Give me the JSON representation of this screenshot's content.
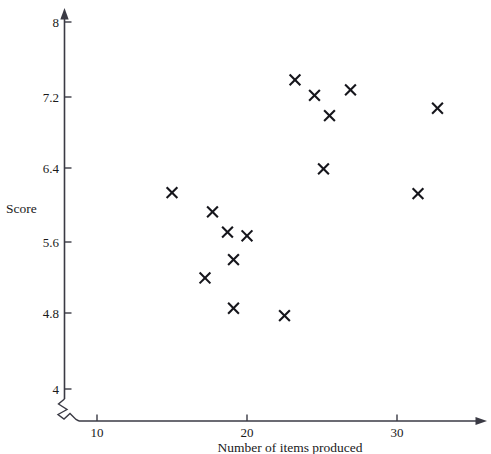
{
  "chart_data": {
    "type": "scatter",
    "title": "",
    "xlabel": "Number of items produced",
    "ylabel": "Score",
    "xlim": [
      8.3,
      34.5
    ],
    "ylim": [
      3.85,
      8.15
    ],
    "grid": false,
    "legend": null,
    "axis_break": {
      "x": true,
      "y": true
    },
    "xticks": [
      10,
      20,
      30
    ],
    "xticklabels": [
      "10",
      "20",
      "30"
    ],
    "yticks": [
      4,
      4.8,
      5.6,
      6.4,
      7.2,
      8
    ],
    "yticklabels": [
      "4",
      "4.8",
      "5.6",
      "6.4",
      "7.2",
      "8"
    ],
    "marker": "x",
    "points": [
      {
        "x": 15.0,
        "y": 6.14
      },
      {
        "x": 17.7,
        "y": 5.93
      },
      {
        "x": 18.7,
        "y": 5.71
      },
      {
        "x": 20.0,
        "y": 5.67
      },
      {
        "x": 19.1,
        "y": 5.41
      },
      {
        "x": 17.2,
        "y": 5.21
      },
      {
        "x": 19.1,
        "y": 4.88
      },
      {
        "x": 22.5,
        "y": 4.8
      },
      {
        "x": 23.2,
        "y": 7.37
      },
      {
        "x": 24.5,
        "y": 7.2
      },
      {
        "x": 25.5,
        "y": 6.98
      },
      {
        "x": 26.9,
        "y": 7.26
      },
      {
        "x": 25.1,
        "y": 6.4
      },
      {
        "x": 31.4,
        "y": 6.13
      },
      {
        "x": 32.7,
        "y": 7.06
      }
    ]
  },
  "axis": {
    "x_title": "Number of items produced",
    "y_title": "Score",
    "xticklabels": [
      "10",
      "20",
      "30"
    ],
    "yticklabels": [
      "4",
      "4.8",
      "5.6",
      "6.4",
      "7.2",
      "8"
    ]
  },
  "colors": {
    "marker": "#16161c",
    "axis": "#3a3a44",
    "text": "#1a1a1a",
    "background": "#ffffff"
  }
}
